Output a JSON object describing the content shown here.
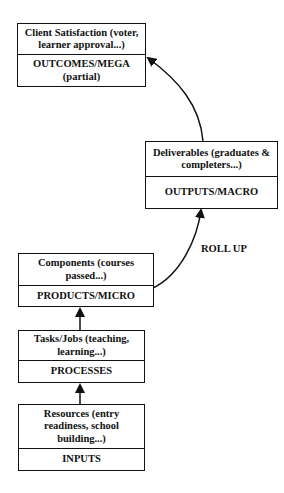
{
  "diagram": {
    "type": "hierarchy-flow",
    "boxes": [
      {
        "id": "outcomes",
        "top": "Client Satisfaction (voter, learner approval...)",
        "bottom": "OUTCOMES/MEGA (partial)"
      },
      {
        "id": "outputs",
        "top": "Deliverables (graduates & completers...)",
        "bottom": "OUTPUTS/MACRO"
      },
      {
        "id": "products",
        "top": "Components (courses passed...)",
        "bottom": "PRODUCTS/MICRO"
      },
      {
        "id": "processes",
        "top": "Tasks/Jobs (teaching, learning...)",
        "bottom": "PROCESSES"
      },
      {
        "id": "inputs",
        "top": "Resources (entry readiness, school building...)",
        "bottom": "INPUTS"
      }
    ],
    "edges": [
      {
        "from": "inputs",
        "to": "processes",
        "style": "straight-arrow"
      },
      {
        "from": "processes",
        "to": "products",
        "style": "straight-arrow"
      },
      {
        "from": "products",
        "to": "outputs",
        "style": "curved-arrow"
      },
      {
        "from": "outputs",
        "to": "outcomes",
        "style": "curved-arrow"
      }
    ],
    "annotation": "ROLL UP",
    "colors": {
      "line": "#111111",
      "background": "#ffffff"
    }
  }
}
